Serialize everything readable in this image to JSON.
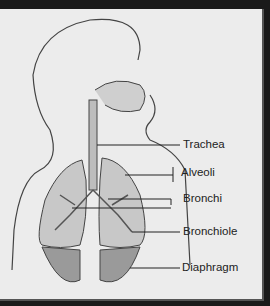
{
  "diagram": {
    "labels": [
      {
        "id": "trachea",
        "text": "Trachea"
      },
      {
        "id": "alveoli",
        "text": "Alveoli"
      },
      {
        "id": "bronchi",
        "text": "Bronchi"
      },
      {
        "id": "bronchiole",
        "text": "Bronchiole"
      },
      {
        "id": "diaphragm",
        "text": "Diaphragm"
      }
    ],
    "colors": {
      "background": "#ececec",
      "frame": "#1a1a1a",
      "lung_fill": "#c8c8c8",
      "line": "#333333"
    }
  }
}
